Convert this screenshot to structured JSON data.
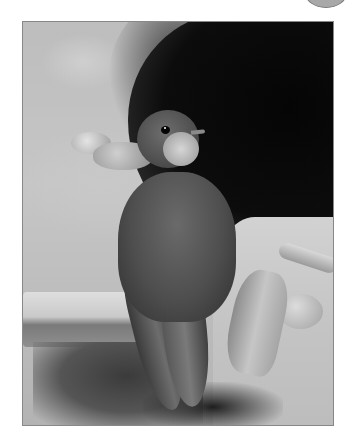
{
  "image": {
    "description": "Grayscale photograph of a sand martin perched on rocks at the mouth of a dark burrow",
    "subject": "bird",
    "palette": {
      "background": "#ffffff",
      "sand": "#c4c4c4",
      "cave": "#0a0a0a",
      "bird": "#4e4e4e",
      "throat": "#d6d6d6",
      "corner_circle": "#a8a8a8"
    }
  }
}
